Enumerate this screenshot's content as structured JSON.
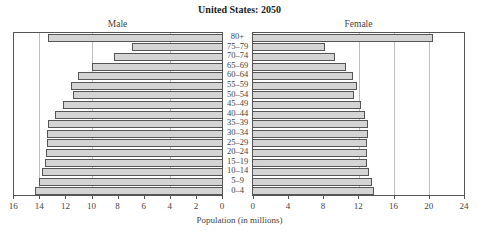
{
  "chart_data": {
    "type": "bar",
    "subtype": "population-pyramid",
    "title": "United States: 2050",
    "xlabel": "Population (in millions)",
    "ylabel": "",
    "categories": [
      "80+",
      "75–79",
      "70–74",
      "65–69",
      "60–64",
      "55–59",
      "50–54",
      "45–49",
      "40–44",
      "35–39",
      "30–34",
      "25–29",
      "20–24",
      "15–19",
      "10–14",
      "5–9",
      "0–4"
    ],
    "series": [
      {
        "name": "Male",
        "values": [
          13.3,
          6.9,
          8.3,
          10.0,
          11.0,
          11.6,
          11.4,
          12.2,
          12.8,
          13.3,
          13.4,
          13.4,
          13.5,
          13.6,
          13.8,
          14.0,
          14.3
        ]
      },
      {
        "name": "Female",
        "values": [
          20.5,
          8.2,
          9.3,
          10.6,
          11.4,
          11.8,
          11.5,
          12.3,
          12.7,
          13.1,
          13.1,
          13.0,
          12.9,
          13.0,
          13.2,
          13.5,
          13.8
        ]
      }
    ],
    "male_axis": {
      "ticks": [
        16,
        14,
        12,
        10,
        8,
        6,
        4,
        2,
        0
      ],
      "xlim": [
        16,
        0
      ],
      "gridlines": [
        14,
        10,
        4
      ]
    },
    "female_axis": {
      "ticks": [
        0,
        4,
        8,
        12,
        16,
        20,
        24
      ],
      "xlim": [
        0,
        24
      ],
      "gridlines": [
        12,
        16,
        20
      ]
    },
    "grid": true,
    "legend_position": "top (panel headers)"
  },
  "labels": {
    "title": "United States: 2050",
    "male": "Male",
    "female": "Female",
    "xlabel": "Population (in millions)"
  },
  "colors": {
    "bar_fill": "#d4d4d4",
    "bar_border": "#555555",
    "gridline": "#bdbdbd"
  }
}
